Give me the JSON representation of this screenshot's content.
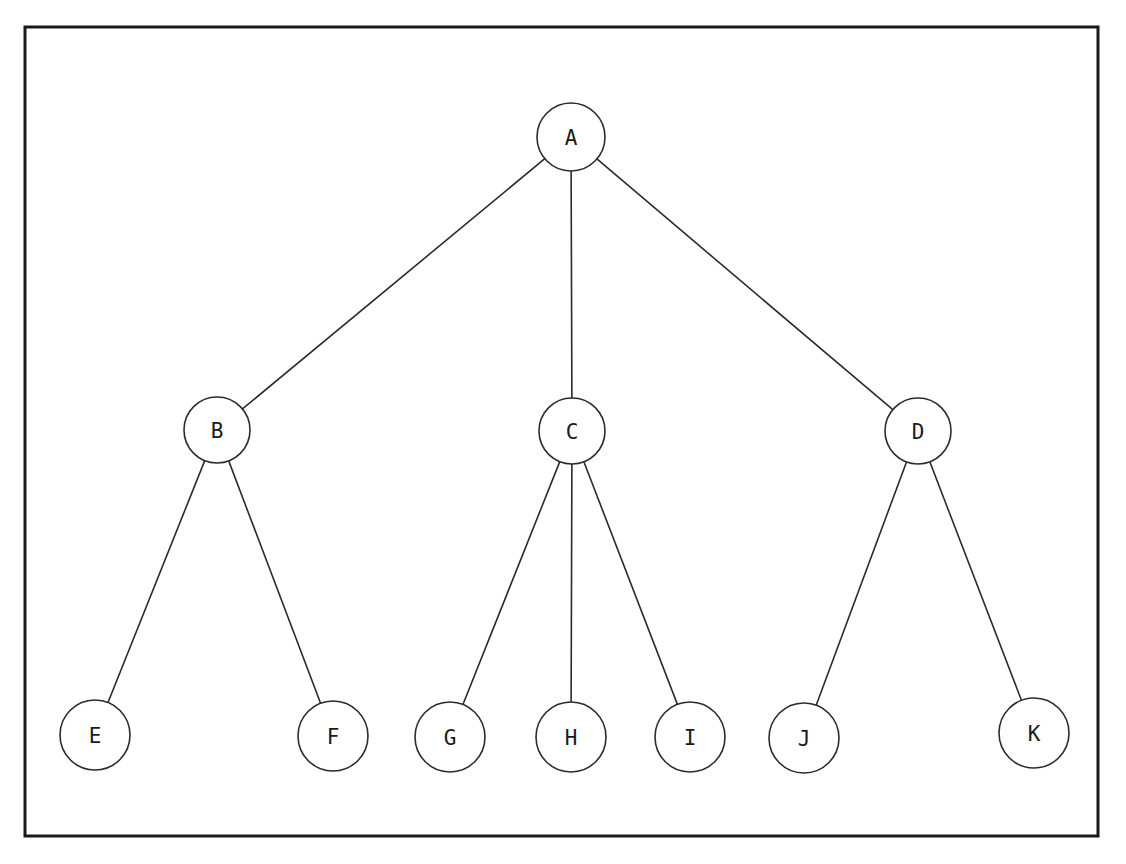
{
  "diagram": {
    "kind": "tree-diagram",
    "background_color": "#ffffff",
    "frame": {
      "name": "outer-border",
      "x": 25,
      "y": 27,
      "width": 1073,
      "height": 809,
      "stroke_color": "#1a1a1a",
      "stroke_width": 3
    },
    "style": {
      "node_fill": "#ffffff",
      "node_stroke": "#2b2b2b",
      "node_stroke_width": 1.6,
      "edge_stroke": "#2b2b2b",
      "edge_stroke_width": 1.6,
      "label_color": "#1a1a1a",
      "label_font_size": 21
    },
    "levels": [
      {
        "level": 1,
        "node_ids": [
          "A"
        ]
      },
      {
        "level": 2,
        "node_ids": [
          "B",
          "C",
          "D"
        ]
      },
      {
        "level": 3,
        "node_ids": [
          "E",
          "F",
          "G",
          "H",
          "I",
          "J",
          "K"
        ]
      }
    ],
    "nodes": [
      {
        "id": "A",
        "label": "A",
        "cx": 571,
        "cy": 137,
        "r": 34,
        "level": 1,
        "parent": null
      },
      {
        "id": "B",
        "label": "B",
        "cx": 217,
        "cy": 430,
        "r": 33,
        "level": 2,
        "parent": "A"
      },
      {
        "id": "C",
        "label": "C",
        "cx": 572,
        "cy": 431,
        "r": 33,
        "level": 2,
        "parent": "A"
      },
      {
        "id": "D",
        "label": "D",
        "cx": 918,
        "cy": 431,
        "r": 33,
        "level": 2,
        "parent": "A"
      },
      {
        "id": "E",
        "label": "E",
        "cx": 95,
        "cy": 735,
        "r": 35,
        "level": 3,
        "parent": "B"
      },
      {
        "id": "F",
        "label": "F",
        "cx": 333,
        "cy": 736,
        "r": 35,
        "level": 3,
        "parent": "B"
      },
      {
        "id": "G",
        "label": "G",
        "cx": 450,
        "cy": 737,
        "r": 35,
        "level": 3,
        "parent": "C"
      },
      {
        "id": "H",
        "label": "H",
        "cx": 571,
        "cy": 737,
        "r": 35,
        "level": 3,
        "parent": "C"
      },
      {
        "id": "I",
        "label": "I",
        "cx": 690,
        "cy": 737,
        "r": 35,
        "level": 3,
        "parent": "C"
      },
      {
        "id": "J",
        "label": "J",
        "cx": 804,
        "cy": 738,
        "r": 35,
        "level": 3,
        "parent": "D"
      },
      {
        "id": "K",
        "label": "K",
        "cx": 1034,
        "cy": 733,
        "r": 35,
        "level": 3,
        "parent": "D"
      }
    ],
    "edges": [
      {
        "id": "A-B",
        "from": "A",
        "to": "B"
      },
      {
        "id": "A-C",
        "from": "A",
        "to": "C"
      },
      {
        "id": "A-D",
        "from": "A",
        "to": "D"
      },
      {
        "id": "B-E",
        "from": "B",
        "to": "E"
      },
      {
        "id": "B-F",
        "from": "B",
        "to": "F"
      },
      {
        "id": "C-G",
        "from": "C",
        "to": "G"
      },
      {
        "id": "C-H",
        "from": "C",
        "to": "H"
      },
      {
        "id": "C-I",
        "from": "C",
        "to": "I"
      },
      {
        "id": "D-J",
        "from": "D",
        "to": "J"
      },
      {
        "id": "D-K",
        "from": "D",
        "to": "K"
      }
    ]
  }
}
